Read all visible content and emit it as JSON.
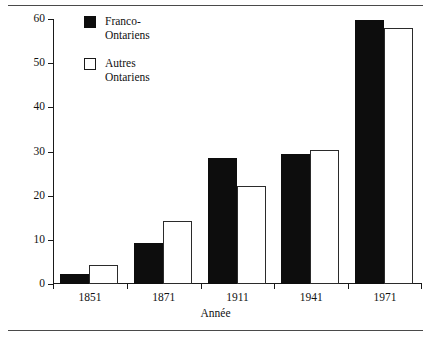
{
  "chart_data": {
    "type": "bar",
    "title": "",
    "xlabel": "Année",
    "ylabel": "Pour cent",
    "categories": [
      "1851",
      "1871",
      "1911",
      "1941",
      "1971"
    ],
    "series": [
      {
        "name": "Franco-Ontariens",
        "color": "#0d0d0d",
        "values": [
          2.3,
          9.3,
          28.5,
          29.5,
          59.8
        ]
      },
      {
        "name": "Autres Ontariens",
        "color": "#ffffff",
        "values": [
          4.3,
          14.2,
          22.3,
          30.4,
          58.0
        ]
      }
    ],
    "ylim": [
      0,
      60
    ],
    "yticks": [
      0,
      10,
      20,
      30,
      40,
      50,
      60
    ],
    "ytick_labels": [
      "0",
      "10",
      "20",
      "30",
      "40",
      "50",
      "60"
    ],
    "grid": false,
    "legend_position": "top-left-inside"
  },
  "legend": {
    "items": [
      {
        "label": "Franco-\nOntariens",
        "swatch": "dark-square-icon"
      },
      {
        "label": "Autres\nOntariens",
        "swatch": "light-square-icon"
      }
    ]
  }
}
